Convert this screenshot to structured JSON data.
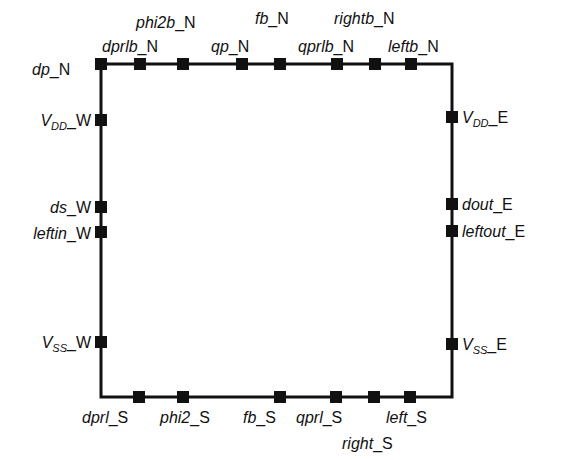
{
  "diagram": {
    "colors": {
      "line": "#111111",
      "pin": "#111111",
      "background": "#ffffff"
    },
    "box": {
      "left": 101,
      "top": 64,
      "right": 452,
      "bottom": 397
    },
    "north": [
      {
        "name": "dp",
        "suffix": "_N",
        "x": 101
      },
      {
        "name": "dprlb",
        "suffix": "_N",
        "x": 140
      },
      {
        "name": "phi2b",
        "suffix": "_N",
        "x": 183
      },
      {
        "name": "qp",
        "suffix": "_N",
        "x": 242
      },
      {
        "name": "fb",
        "suffix": "_N",
        "x": 280
      },
      {
        "name": "qprlb",
        "suffix": "_N",
        "x": 337
      },
      {
        "name": "rightb",
        "suffix": "_N",
        "x": 375
      },
      {
        "name": "leftb",
        "suffix": "_N",
        "x": 411
      }
    ],
    "west": [
      {
        "name": "V",
        "sub": "DD",
        "suffix": "_W",
        "y": 120
      },
      {
        "name": "ds",
        "suffix": "_W",
        "y": 207
      },
      {
        "name": "leftin",
        "suffix": "_W",
        "y": 232
      },
      {
        "name": "V",
        "sub": "SS",
        "suffix": "_W",
        "y": 342
      }
    ],
    "east": [
      {
        "name": "V",
        "sub": "DD",
        "suffix": "_E",
        "y": 117
      },
      {
        "name": "dout",
        "suffix": "_E",
        "y": 204
      },
      {
        "name": "leftout",
        "suffix": "_E",
        "y": 231
      },
      {
        "name": "V",
        "sub": "SS",
        "suffix": "_E",
        "y": 344
      }
    ],
    "south": [
      {
        "name": "dprl",
        "suffix": "_S",
        "x": 139
      },
      {
        "name": "phi2",
        "suffix": "_S",
        "x": 183
      },
      {
        "name": "fb",
        "suffix": "_S",
        "x": 280
      },
      {
        "name": "qprl",
        "suffix": "_S",
        "x": 336
      },
      {
        "name": "right",
        "suffix": "_S",
        "x": 374
      },
      {
        "name": "left",
        "suffix": "_S",
        "x": 410
      }
    ]
  }
}
